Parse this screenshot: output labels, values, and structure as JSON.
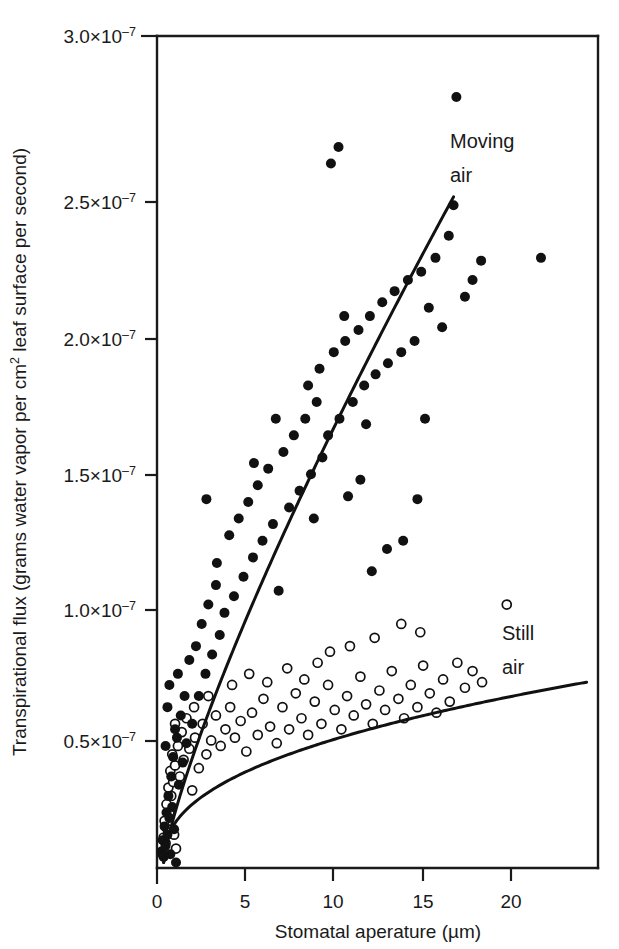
{
  "chart_data": {
    "type": "scatter",
    "title": "",
    "xlabel": "Stomatal aperature (µm)",
    "ylabel": "Transpirational flux (grams water vapor per cm² leaf surface per second)",
    "ylabel_parts": {
      "before": "Transpirational flux (grams water vapor per cm",
      "sup": "2",
      "after": " leaf surface per second)"
    },
    "xlim": [
      0,
      23.2
    ],
    "ylim": [
      0,
      3.0
    ],
    "y_unit_exponent": "×10⁻⁷",
    "grid": false,
    "legend_position": "in-plot-annotations",
    "xticks": [
      0,
      5,
      10,
      15,
      20
    ],
    "xticklabels": [
      "0",
      "5",
      "10",
      "15",
      "20"
    ],
    "yticks": [
      0.5,
      1.0,
      1.5,
      2.0,
      2.5,
      3.0
    ],
    "yticklabels": [
      {
        "mantissa": "0.5×10",
        "exp": "–7"
      },
      {
        "mantissa": "1.0×10",
        "exp": "–7"
      },
      {
        "mantissa": "1.5×10",
        "exp": "–7"
      },
      {
        "mantissa": "2.0×10",
        "exp": "–7"
      },
      {
        "mantissa": "2.5×10",
        "exp": "–7"
      },
      {
        "mantissa": "3.0×10",
        "exp": "–7"
      }
    ],
    "annotations": [
      {
        "name": "moving-air-label",
        "text_line1": "Moving",
        "text_line2": "air",
        "x": 16.6,
        "y": 2.72
      },
      {
        "name": "still-air-label",
        "text_line1": "Still",
        "text_line2": "air",
        "x": 18.3,
        "y": 0.9
      }
    ],
    "series": [
      {
        "name": "Moving air",
        "marker": "filled-circle",
        "marker_color": "#111111",
        "marker_radius": 5.0,
        "points": [
          [
            0.25,
            0.06
          ],
          [
            0.3,
            0.1
          ],
          [
            0.35,
            0.04
          ],
          [
            0.4,
            0.15
          ],
          [
            0.45,
            0.08
          ],
          [
            0.5,
            0.2
          ],
          [
            0.55,
            0.12
          ],
          [
            0.6,
            0.26
          ],
          [
            0.65,
            0.18
          ],
          [
            0.7,
            0.05
          ],
          [
            0.75,
            0.33
          ],
          [
            0.8,
            0.22
          ],
          [
            0.85,
            0.4
          ],
          [
            0.9,
            0.14
          ],
          [
            1.0,
            0.02
          ],
          [
            1.05,
            0.47
          ],
          [
            1.15,
            0.3
          ],
          [
            1.25,
            0.55
          ],
          [
            1.35,
            0.38
          ],
          [
            1.45,
            0.62
          ],
          [
            0.55,
            0.58
          ],
          [
            0.65,
            0.66
          ],
          [
            0.45,
            0.44
          ],
          [
            0.95,
            0.5
          ],
          [
            1.1,
            0.7
          ],
          [
            1.55,
            0.45
          ],
          [
            1.7,
            0.75
          ],
          [
            1.85,
            0.52
          ],
          [
            2.05,
            0.8
          ],
          [
            2.2,
            0.62
          ],
          [
            2.35,
            0.88
          ],
          [
            2.55,
            0.7
          ],
          [
            2.7,
            0.95
          ],
          [
            2.9,
            0.77
          ],
          [
            3.1,
            1.02
          ],
          [
            3.3,
            0.84
          ],
          [
            2.6,
            1.33
          ],
          [
            3.15,
            1.1
          ],
          [
            3.55,
            0.92
          ],
          [
            3.8,
            1.2
          ],
          [
            4.05,
            0.98
          ],
          [
            4.3,
            1.26
          ],
          [
            4.55,
            1.05
          ],
          [
            4.8,
            1.32
          ],
          [
            5.05,
            1.12
          ],
          [
            5.3,
            1.38
          ],
          [
            5.55,
            1.18
          ],
          [
            5.85,
            1.44
          ],
          [
            6.1,
            1.24
          ],
          [
            6.4,
            1.0
          ],
          [
            6.65,
            1.5
          ],
          [
            6.95,
            1.3
          ],
          [
            7.2,
            1.56
          ],
          [
            7.5,
            1.36
          ],
          [
            7.8,
            1.62
          ],
          [
            8.1,
            1.42
          ],
          [
            8.4,
            1.68
          ],
          [
            8.7,
            1.48
          ],
          [
            7.95,
            1.74
          ],
          [
            8.55,
            1.8
          ],
          [
            9.0,
            1.56
          ],
          [
            9.3,
            1.86
          ],
          [
            9.6,
            1.62
          ],
          [
            9.9,
            1.9
          ],
          [
            8.25,
            1.26
          ],
          [
            9.15,
            2.54
          ],
          [
            9.55,
            2.6
          ],
          [
            10.3,
            1.68
          ],
          [
            10.6,
            1.94
          ],
          [
            10.9,
            1.74
          ],
          [
            11.2,
            1.99
          ],
          [
            11.5,
            1.78
          ],
          [
            11.85,
            2.04
          ],
          [
            10.05,
            1.34
          ],
          [
            10.7,
            1.4
          ],
          [
            12.15,
            1.82
          ],
          [
            12.5,
            2.08
          ],
          [
            12.85,
            1.86
          ],
          [
            11.3,
            1.07
          ],
          [
            12.1,
            1.15
          ],
          [
            13.2,
            2.12
          ],
          [
            13.55,
            1.9
          ],
          [
            13.9,
            2.15
          ],
          [
            12.95,
            1.18
          ],
          [
            13.7,
            1.33
          ],
          [
            14.3,
            2.02
          ],
          [
            14.65,
            2.2
          ],
          [
            15.0,
            1.95
          ],
          [
            15.35,
            2.28
          ],
          [
            15.75,
            2.78
          ],
          [
            15.6,
            2.39
          ],
          [
            16.2,
            2.06
          ],
          [
            16.6,
            2.12
          ],
          [
            17.05,
            2.19
          ],
          [
            20.2,
            2.2
          ],
          [
            14.1,
            1.62
          ],
          [
            9.85,
            1.99
          ],
          [
            11.0,
            1.6
          ],
          [
            6.25,
            1.62
          ],
          [
            5.1,
            1.46
          ]
        ]
      },
      {
        "name": "Still air",
        "marker": "open-circle",
        "marker_color": "#ffffff",
        "marker_edge": "#111111",
        "marker_radius": 4.5,
        "points": [
          [
            0.3,
            0.05
          ],
          [
            0.35,
            0.11
          ],
          [
            0.4,
            0.17
          ],
          [
            0.45,
            0.09
          ],
          [
            0.5,
            0.23
          ],
          [
            0.55,
            0.14
          ],
          [
            0.6,
            0.29
          ],
          [
            0.65,
            0.2
          ],
          [
            0.7,
            0.35
          ],
          [
            0.75,
            0.26
          ],
          [
            0.8,
            0.41
          ],
          [
            0.85,
            0.31
          ],
          [
            0.9,
            0.12
          ],
          [
            0.95,
            0.37
          ],
          [
            1.0,
            0.07
          ],
          [
            1.1,
            0.44
          ],
          [
            1.2,
            0.33
          ],
          [
            1.3,
            0.49
          ],
          [
            1.4,
            0.39
          ],
          [
            1.55,
            0.54
          ],
          [
            1.7,
            0.43
          ],
          [
            1.85,
            0.28
          ],
          [
            2.0,
            0.47
          ],
          [
            2.2,
            0.36
          ],
          [
            2.4,
            0.52
          ],
          [
            2.6,
            0.41
          ],
          [
            2.85,
            0.46
          ],
          [
            3.1,
            0.55
          ],
          [
            3.35,
            0.44
          ],
          [
            3.6,
            0.5
          ],
          [
            3.85,
            0.58
          ],
          [
            4.1,
            0.47
          ],
          [
            4.4,
            0.53
          ],
          [
            4.7,
            0.42
          ],
          [
            5.0,
            0.56
          ],
          [
            5.3,
            0.48
          ],
          [
            5.6,
            0.61
          ],
          [
            5.95,
            0.51
          ],
          [
            6.3,
            0.45
          ],
          [
            6.6,
            0.58
          ],
          [
            6.95,
            0.5
          ],
          [
            7.3,
            0.63
          ],
          [
            7.6,
            0.54
          ],
          [
            7.95,
            0.48
          ],
          [
            8.3,
            0.6
          ],
          [
            8.65,
            0.52
          ],
          [
            9.0,
            0.66
          ],
          [
            9.35,
            0.57
          ],
          [
            9.7,
            0.5
          ],
          [
            10.0,
            0.62
          ],
          [
            10.35,
            0.55
          ],
          [
            10.7,
            0.69
          ],
          [
            11.0,
            0.59
          ],
          [
            11.35,
            0.52
          ],
          [
            11.7,
            0.64
          ],
          [
            12.0,
            0.57
          ],
          [
            12.35,
            0.71
          ],
          [
            12.7,
            0.61
          ],
          [
            13.0,
            0.54
          ],
          [
            13.35,
            0.66
          ],
          [
            13.7,
            0.58
          ],
          [
            14.0,
            0.73
          ],
          [
            14.35,
            0.63
          ],
          [
            14.7,
            0.56
          ],
          [
            15.05,
            0.68
          ],
          [
            15.4,
            0.6
          ],
          [
            15.8,
            0.74
          ],
          [
            16.2,
            0.65
          ],
          [
            16.6,
            0.71
          ],
          [
            17.1,
            0.67
          ],
          [
            18.4,
            0.95
          ],
          [
            13.85,
            0.85
          ],
          [
            12.85,
            0.88
          ],
          [
            11.45,
            0.83
          ],
          [
            10.15,
            0.8
          ],
          [
            9.1,
            0.78
          ],
          [
            8.45,
            0.74
          ],
          [
            7.75,
            0.68
          ],
          [
            6.85,
            0.72
          ],
          [
            2.7,
            0.62
          ],
          [
            3.95,
            0.66
          ],
          [
            1.95,
            0.58
          ],
          [
            4.85,
            0.7
          ],
          [
            5.8,
            0.67
          ],
          [
            0.95,
            0.52
          ]
        ]
      }
    ],
    "fit_curves": [
      {
        "name": "moving-air-fit",
        "label": "Moving air",
        "start": [
          0.35,
          0.02
        ],
        "end": [
          15.6,
          2.42
        ],
        "shape": "concave-increasing"
      },
      {
        "name": "still-air-fit",
        "label": "Still air",
        "start": [
          0.35,
          0.02
        ],
        "end": [
          22.6,
          0.67
        ],
        "shape": "saturating"
      }
    ]
  }
}
